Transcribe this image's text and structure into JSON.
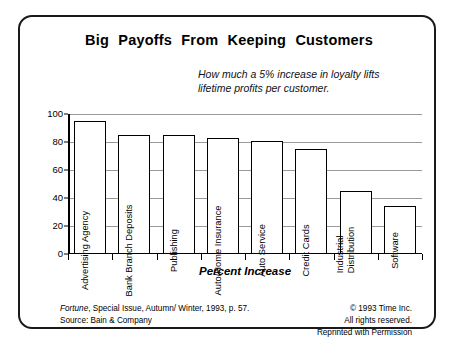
{
  "chart_data": {
    "type": "bar",
    "title": "Big  Payoffs  From  Keeping  Customers",
    "subtitle_line1": "How much a 5% increase in loyalty lifts",
    "subtitle_line2": "lifetime profits per customer.",
    "categories": [
      "Advertising Agency",
      "Bank Branch Deposits",
      "Publishing",
      "Auto/Home Insurance",
      "Auto Service",
      "Credit Cards",
      "Industrial Distribution",
      "Software"
    ],
    "category_lines": [
      [
        "Advertising Agency"
      ],
      [
        "Bank Branch Deposits"
      ],
      [
        "Publishing"
      ],
      [
        "Auto/Home Insurance"
      ],
      [
        "Auto Service"
      ],
      [
        "Credit Cards"
      ],
      [
        "Industrial",
        "Distribution"
      ],
      [
        "Software"
      ]
    ],
    "values": [
      95,
      85,
      85,
      83,
      81,
      75,
      45,
      34
    ],
    "xlabel": "Percent Increase",
    "ylabel": "",
    "ylim": [
      0,
      100
    ],
    "yticks": [
      100,
      80,
      60,
      40,
      20,
      0
    ],
    "grid": true,
    "legend": "none",
    "bar_fill": "#ffffff",
    "bar_border": "#000000",
    "gridline_color": "#9a9a9a"
  },
  "footer": {
    "source_italic": "Fortune",
    "source_rest": ", Special Issue, Autumn/ Winter, 1993, p. 57.",
    "source_line2": "Source:  Bain & Company",
    "copyright_line1": "© 1993 Time Inc.",
    "copyright_line2": "All rights reserved.",
    "copyright_line3": "Reprinted with Permission"
  }
}
